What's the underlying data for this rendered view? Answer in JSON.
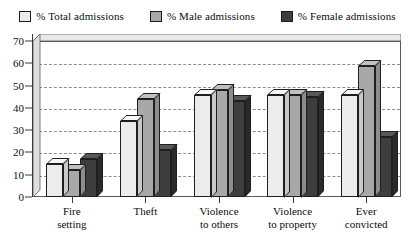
{
  "chart_data": {
    "type": "bar",
    "title": "",
    "xlabel": "",
    "ylabel": "",
    "ylim": [
      0,
      70
    ],
    "ytick_step": 10,
    "yticks": [
      0,
      10,
      20,
      30,
      40,
      50,
      60,
      70
    ],
    "grid": true,
    "legend_position": "top",
    "categories": [
      "Fire setting",
      "Theft",
      "Violence to others",
      "Violence to property",
      "Ever convicted"
    ],
    "category_lines": [
      [
        "Fire",
        "setting"
      ],
      [
        "Theft",
        ""
      ],
      [
        "Violence",
        "to others"
      ],
      [
        "Violence",
        "to property"
      ],
      [
        "Ever",
        "convicted"
      ]
    ],
    "series": [
      {
        "name": "% Total admissions",
        "color": "#ececec",
        "top_color": "#f7f7f7",
        "side_color": "#c9c9c9",
        "values": [
          15,
          34,
          46,
          46,
          46
        ]
      },
      {
        "name": "% Male admissions",
        "color": "#a8a8a8",
        "top_color": "#c0c0c0",
        "side_color": "#8d8d8d",
        "values": [
          12,
          44,
          48,
          46,
          59
        ]
      },
      {
        "name": "% Female admissions",
        "color": "#3d3d3d",
        "top_color": "#585858",
        "side_color": "#2a2a2a",
        "values": [
          17,
          21,
          43,
          45,
          27
        ]
      }
    ]
  },
  "legend": {
    "items": [
      {
        "label": "% Total admissions"
      },
      {
        "label": "% Male admissions"
      },
      {
        "label": "% Female admissions"
      }
    ]
  }
}
